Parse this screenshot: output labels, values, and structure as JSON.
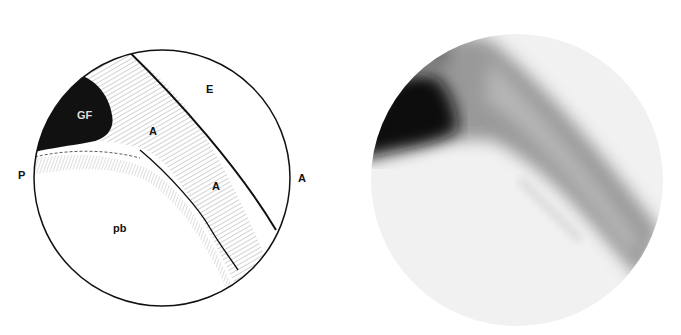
{
  "figure": {
    "drawing": {
      "description": "Line drawing of arthroscopic circular field of view",
      "labels": {
        "E": "E",
        "GF": "GF",
        "A_upper": "A",
        "A_middle": "A",
        "A_right": "A",
        "P": "P",
        "pb": "pb"
      }
    },
    "photo": {
      "description": "Grayscale arthroscopic photograph corresponding to the drawing"
    }
  }
}
